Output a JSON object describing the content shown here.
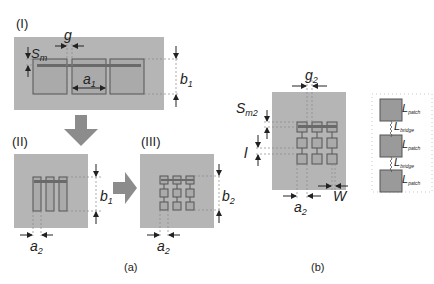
{
  "colors": {
    "substrate": "#b5b5b5",
    "patch": "#a9a9a9",
    "stroke": "#555555",
    "arrow": "#8c8c8c",
    "dash": "#888888",
    "text": "#222222"
  },
  "panel_a": {
    "caption": "(a)",
    "stage_I": {
      "label": "(I)",
      "dims": {
        "sm": "S",
        "sm_sub": "m",
        "g": "g",
        "a1": "a",
        "a1_sub": "1",
        "b1": "b",
        "b1_sub": "1"
      }
    },
    "stage_II": {
      "label": "(II)",
      "dims": {
        "a2": "a",
        "a2_sub": "2",
        "b1": "b",
        "b1_sub": "1"
      }
    },
    "stage_III": {
      "label": "(III)",
      "dims": {
        "a2": "a",
        "a2_sub": "2",
        "b2": "b",
        "b2_sub": "2"
      }
    }
  },
  "panel_b": {
    "caption": "(b)",
    "dims": {
      "g2": "g",
      "g2_sub": "2",
      "sm2": "S",
      "sm2_sub": "m2",
      "l": "l",
      "a2": "a",
      "a2_sub": "2",
      "w": "W"
    },
    "equivalent_circuit": {
      "labels": [
        {
          "main": "L",
          "sub": "patch"
        },
        {
          "main": "L",
          "sub": "bridge"
        },
        {
          "main": "L",
          "sub": "patch"
        },
        {
          "main": "L",
          "sub": "bridge"
        },
        {
          "main": "L",
          "sub": "patch"
        }
      ]
    }
  }
}
